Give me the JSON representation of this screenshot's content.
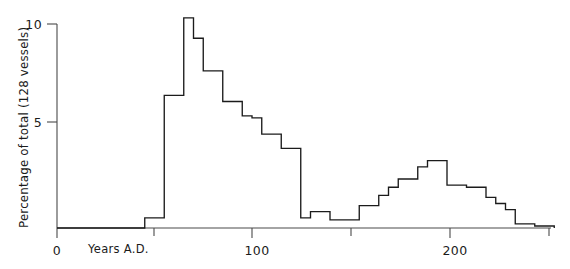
{
  "chart_data": {
    "type": "area",
    "title": "",
    "subtitle": "",
    "xlabel": "Years A.D.",
    "ylabel": "Percentage of total (128 vessels)",
    "xlim": [
      -5,
      255
    ],
    "ylim": [
      0,
      10.5
    ],
    "grid": false,
    "legend": null,
    "x_ticks": [
      0,
      100,
      200
    ],
    "x_tick_labels": [
      "0",
      "100",
      "200"
    ],
    "x_minor_ticks": [
      50,
      150,
      250
    ],
    "y_ticks": [
      0,
      5,
      10
    ],
    "y_tick_labels": [
      "0",
      "5",
      "10"
    ],
    "bin_width": 5,
    "bin_starts": [
      0,
      5,
      10,
      15,
      20,
      25,
      30,
      35,
      40,
      45,
      50,
      55,
      60,
      65,
      70,
      75,
      80,
      85,
      90,
      95,
      100,
      105,
      110,
      115,
      120,
      125,
      130,
      135,
      140,
      145,
      150,
      155,
      160,
      165,
      170,
      175,
      180,
      185,
      190,
      195,
      200,
      205,
      210,
      215,
      220,
      225,
      230,
      235,
      240,
      245,
      250
    ],
    "values": [
      0,
      0,
      0,
      0,
      0,
      0,
      0,
      0,
      0,
      0.5,
      0.5,
      6.5,
      6.5,
      10.3,
      9.3,
      7.7,
      7.7,
      6.2,
      6.2,
      5.5,
      5.4,
      4.6,
      4.6,
      3.9,
      3.9,
      0.5,
      0.8,
      0.8,
      0.4,
      0.4,
      0.4,
      1.1,
      1.1,
      1.6,
      2.0,
      2.4,
      2.4,
      3.0,
      3.3,
      3.3,
      2.1,
      2.1,
      2.0,
      2.0,
      1.5,
      1.2,
      0.9,
      0.2,
      0.2,
      0.1,
      0.1
    ],
    "series": [
      {
        "name": "Vessel frequency",
        "values": [
          0,
          0,
          0,
          0,
          0,
          0,
          0,
          0,
          0,
          0.5,
          0.5,
          6.5,
          6.5,
          10.3,
          9.3,
          7.7,
          7.7,
          6.2,
          6.2,
          5.5,
          5.4,
          4.6,
          4.6,
          3.9,
          3.9,
          0.5,
          0.8,
          0.8,
          0.4,
          0.4,
          0.4,
          1.1,
          1.1,
          1.6,
          2.0,
          2.4,
          2.4,
          3.0,
          3.3,
          3.3,
          2.1,
          2.1,
          2.0,
          2.0,
          1.5,
          1.2,
          0.9,
          0.2,
          0.2,
          0.1,
          0.1
        ]
      }
    ],
    "peak_year": 65,
    "peak_value": 10.3,
    "secondary_peak_year": 190,
    "secondary_peak_value": 3.3,
    "total_vessels": 128,
    "line_color": "#1b1b1b",
    "axis_color": "#4a4a4a"
  }
}
